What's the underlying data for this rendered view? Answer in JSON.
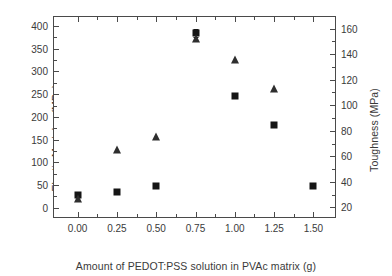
{
  "chart_data": {
    "type": "scatter",
    "title": "",
    "xlabel": "Amount of PEDOT:PSS solution in PVAc matrix (g)",
    "x": [
      0.0,
      0.25,
      0.5,
      0.75,
      1.0,
      1.25,
      1.5
    ],
    "xlim": [
      -0.15,
      1.65
    ],
    "xticks": [
      0.0,
      0.25,
      0.5,
      0.75,
      1.0,
      1.25,
      1.5
    ],
    "xticklabels": [
      "0.00",
      "0.25",
      "0.50",
      "0.75",
      "1.00",
      "1.25",
      "1.50"
    ],
    "grid": false,
    "legend": "none",
    "axes": [
      {
        "id": "left",
        "label": "Elastic Modulus (MPa)",
        "ylim": [
          -25,
          420
        ],
        "yticks": [
          0,
          50,
          100,
          150,
          200,
          250,
          300,
          350,
          400
        ],
        "yticklabels": [
          "0",
          "50",
          "100",
          "150",
          "200",
          "250",
          "300",
          "350",
          "400"
        ]
      },
      {
        "id": "right",
        "label": "Toughness (MPa)",
        "ylim": [
          11,
          169
        ],
        "yticks": [
          20,
          40,
          60,
          80,
          100,
          120,
          140,
          160
        ],
        "yticklabels": [
          "20",
          "40",
          "60",
          "80",
          "100",
          "120",
          "140",
          "160"
        ]
      }
    ],
    "series": [
      {
        "name": "Elastic Modulus",
        "axis": "left",
        "marker": "square",
        "color": "#151515",
        "values": [
          28,
          35,
          48,
          385,
          246,
          183,
          47
        ],
        "errors": [
          0,
          0,
          0,
          8,
          0,
          0,
          0
        ]
      },
      {
        "name": "Toughness",
        "axis": "right",
        "marker": "triangle",
        "color": "#2e2e2e",
        "values": [
          27,
          65,
          75,
          152,
          135,
          113,
          null
        ]
      }
    ]
  }
}
